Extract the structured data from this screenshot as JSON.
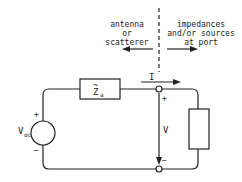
{
  "diagram": {
    "left_region_label": [
      "antenna",
      "or",
      "scatterer"
    ],
    "right_region_label": [
      "impedances",
      "and/or sources",
      "at port"
    ],
    "impedance_label": "Z",
    "impedance_subscript": "a",
    "impedance_accent": "~",
    "current_label": "I",
    "voltage_label": "V",
    "voltage_plus": "+",
    "voltage_minus": "−",
    "source_label": "V",
    "source_subscript": "oc",
    "source_plus": "+",
    "source_minus": "−",
    "line_color": "#222222"
  }
}
